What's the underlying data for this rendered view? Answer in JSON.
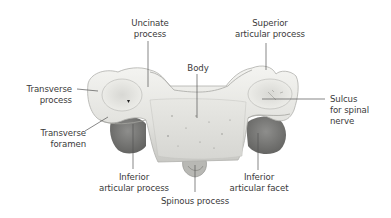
{
  "diagram": {
    "labels": [
      {
        "id": "uncinate-process",
        "text": "Uncinate\nprocess"
      },
      {
        "id": "superior-articular-process",
        "text": "Superior\narticular process"
      },
      {
        "id": "body",
        "text": "Body"
      },
      {
        "id": "transverse-process",
        "text": "Transverse\nprocess"
      },
      {
        "id": "sulcus-for-spinal-nerve",
        "text": "Sulcus\nfor spinal\nnerve"
      },
      {
        "id": "transverse-foramen",
        "text": "Transverse\nforamen"
      },
      {
        "id": "inferior-articular-process",
        "text": "Inferior\narticular process"
      },
      {
        "id": "inferior-articular-facet",
        "text": "Inferior\narticular facet"
      },
      {
        "id": "spinous-process",
        "text": "Spinous process"
      }
    ],
    "colors": {
      "background": "#ffffff",
      "bone_light": "#eeeeea",
      "bone_mid": "#d4d4d0",
      "bone_shadow": "#9a9a96",
      "facet_dark": "#7e7e7c",
      "leader_line": "#555555",
      "text": "#3a3a3a"
    }
  }
}
